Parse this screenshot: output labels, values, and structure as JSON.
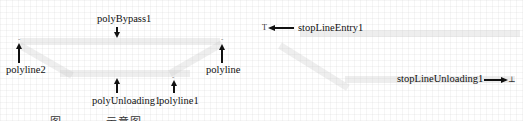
{
  "figure": {
    "left_panel": {
      "labels": {
        "polyBypass1": "polyBypass1",
        "polyline2": "polyline2",
        "polyline": "polyline",
        "polyUnloading1": "polyUnloading1",
        "polyline1": "polyline1"
      }
    },
    "right_panel": {
      "labels": {
        "stopLineEntry1": "stopLineEntry1",
        "stopLineUnloading1": "stopLineUnloading1"
      },
      "markers": {
        "entry": "T",
        "unloading": "⊥"
      }
    },
    "caption": "图 ——— 示意图"
  }
}
